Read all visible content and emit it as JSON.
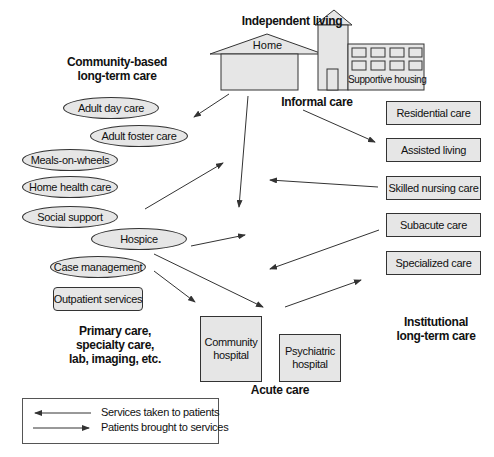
{
  "diagram": {
    "headings": {
      "independent_living": "Independent living",
      "community_based": "Community-based\nlong-term care",
      "informal_care": "Informal care",
      "primary_care": "Primary care,\nspecialty care,\nlab, imaging, etc.",
      "institutional": "Institutional\nlong-term care",
      "acute_care": "Acute care"
    },
    "buildings": {
      "home": "Home",
      "supportive_housing": "Supportive housing"
    },
    "community_services": [
      "Adult day care",
      "Adult foster care",
      "Meals-on-wheels",
      "Home health care",
      "Social support",
      "Hospice",
      "Case management"
    ],
    "outpatient": "Outpatient services",
    "institutional_services": [
      "Residential care",
      "Assisted living",
      "Skilled nursing care",
      "Subacute care",
      "Specialized care"
    ],
    "acute_services": {
      "community_hospital": "Community\nhospital",
      "psychiatric_hospital": "Psychiatric\nhospital"
    },
    "legend": {
      "services_to_patients": "Services taken to patients",
      "patients_to_services": "Patients brought to services"
    },
    "colors": {
      "fill": "#e6e6e6",
      "stroke": "#333333",
      "arrow": "#333333"
    }
  }
}
